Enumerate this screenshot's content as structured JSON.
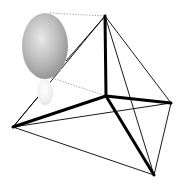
{
  "diagram": {
    "type": "tetrahedral-geometry-with-orbital",
    "background": "#ffffff",
    "vertices": {
      "center": {
        "x": 106,
        "y": 96
      },
      "top": {
        "x": 105,
        "y": 16
      },
      "left": {
        "x": 13,
        "y": 127
      },
      "right": {
        "x": 171,
        "y": 103
      },
      "bottom": {
        "x": 154,
        "y": 175
      }
    },
    "bonds": [
      {
        "from": "center",
        "to": "top",
        "weight": "thick"
      },
      {
        "from": "center",
        "to": "left",
        "weight": "thick"
      },
      {
        "from": "center",
        "to": "right",
        "weight": "thick"
      },
      {
        "from": "center",
        "to": "bottom",
        "weight": "thick"
      }
    ],
    "edges": [
      {
        "from": "top",
        "to": "right",
        "weight": "thin"
      },
      {
        "from": "top",
        "to": "bottom",
        "weight": "thin"
      },
      {
        "from": "right",
        "to": "bottom",
        "weight": "thin"
      },
      {
        "from": "left",
        "to": "right",
        "weight": "thin"
      },
      {
        "from": "left",
        "to": "bottom",
        "weight": "thin"
      },
      {
        "from": "left",
        "to": "top",
        "weight": "thin"
      }
    ],
    "orbital": {
      "large_lobe": {
        "cx": 45,
        "cy": 46,
        "rx": 23,
        "ry": 33,
        "highlight": "#e6e6e6",
        "shade": "#9a9a9a"
      },
      "small_lobe": {
        "cx": 45,
        "cy": 92,
        "rx": 8,
        "ry": 13,
        "highlight": "#ffffff",
        "shade": "#dcdcdc"
      }
    },
    "projection_lines": [
      {
        "x1": 50,
        "y1": 13,
        "x2": 105,
        "y2": 16,
        "style": "dotted"
      },
      {
        "x1": 52,
        "y1": 78,
        "x2": 106,
        "y2": 96,
        "style": "dotted"
      }
    ],
    "colors": {
      "line": "#000000",
      "dotted": "#9a9a9a"
    }
  }
}
